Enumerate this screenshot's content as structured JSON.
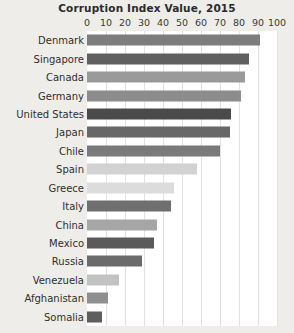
{
  "chart_data": {
    "type": "bar",
    "orientation": "horizontal",
    "title": "Corruption Index Value, 2015",
    "xlabel": "",
    "ylabel": "",
    "xlim": [
      0,
      100
    ],
    "xticks": [
      0,
      10,
      20,
      30,
      40,
      50,
      60,
      70,
      80,
      90,
      100
    ],
    "grid": true,
    "legend": false,
    "background": "#eeedea",
    "plot_background": "#ffffff",
    "gridline_color": "#e3e2df",
    "categories": [
      "Denmark",
      "Singapore",
      "Canada",
      "Germany",
      "United States",
      "Japan",
      "Chile",
      "Spain",
      "Greece",
      "Italy",
      "China",
      "Mexico",
      "Russia",
      "Venezuela",
      "Afghanistan",
      "Somalia"
    ],
    "values": [
      91,
      85,
      83,
      81,
      76,
      75,
      70,
      58,
      46,
      44,
      37,
      35,
      29,
      17,
      11,
      8
    ],
    "bar_colors": [
      "#7d7d7d",
      "#606060",
      "#9a9a9a",
      "#8c8c8c",
      "#4a4a4a",
      "#686868",
      "#7a7a7a",
      "#d2d2d2",
      "#dcdcdc",
      "#6f6f6f",
      "#a6a6a6",
      "#5a5a5a",
      "#6b6b6b",
      "#c2c2c2",
      "#8f8f8f",
      "#5e5e5e"
    ]
  }
}
